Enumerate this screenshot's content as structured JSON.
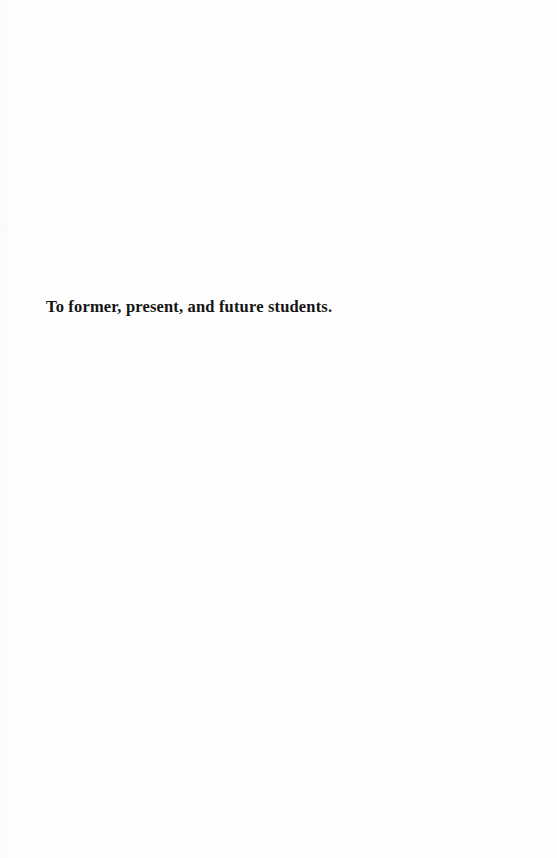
{
  "page": {
    "kind": "book-dedication-page",
    "background_color": "#fefefe",
    "text_color": "#151515"
  },
  "dedication": {
    "text": "To former, present, and future students."
  }
}
